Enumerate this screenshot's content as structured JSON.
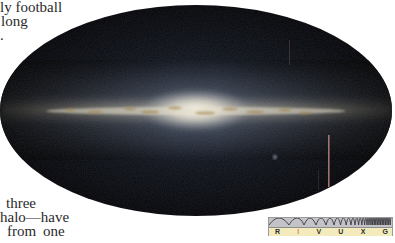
{
  "text_fragments": {
    "top": [
      "ly football",
      "long",
      "."
    ],
    "bottom": [
      "three",
      "halo—have",
      "from one"
    ]
  },
  "figure": {
    "colors": {
      "background": "#000000",
      "disk_core": "#f3ecd9",
      "disk_glow": "#8a94a6",
      "dust": "#b08a4a",
      "streak": "#b9857a"
    }
  },
  "wavelength_bar": {
    "bands": [
      "R",
      "I",
      "V",
      "U",
      "X",
      "G"
    ],
    "highlighted_band": "I",
    "highlight_color": "#d2482a",
    "wave_background": "#c4c3c8",
    "label_background": "#f4ebbd"
  }
}
